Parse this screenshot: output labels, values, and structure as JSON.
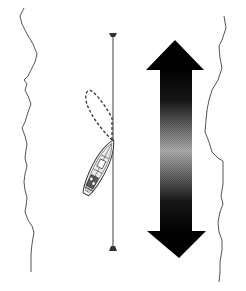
{
  "diagram": {
    "elements": {
      "left_bank": {
        "label": "",
        "color": "#555555"
      },
      "right_bank": {
        "label": "",
        "color": "#555555"
      },
      "transit_line": {
        "label": "",
        "color": "#6b6b6b",
        "x": 113,
        "y_top": 35,
        "y_bottom": 250
      },
      "top_marker": {
        "label": "",
        "shape": "inverted-trapezoid"
      },
      "bottom_marker": {
        "label": "",
        "shape": "trapezoid"
      },
      "boat": {
        "label": "",
        "bow": [
          113,
          140
        ],
        "stern": [
          86,
          195
        ]
      },
      "swing_path": {
        "label": "",
        "style": "dashed"
      },
      "current_arrow": {
        "label": "",
        "direction": "bidirectional-vertical",
        "gradient": [
          "#000000",
          "#b5b5b5",
          "#000000"
        ]
      }
    }
  }
}
